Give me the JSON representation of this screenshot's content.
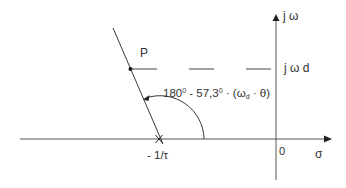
{
  "diagram": {
    "type": "s-plane root locus angle construction",
    "axes": {
      "imaginary_label": "j ω",
      "real_label": "σ",
      "origin_label": "0"
    },
    "point": {
      "label": "P",
      "jw_label": "j ω d"
    },
    "pole": {
      "label": "- 1/τ",
      "marker": "x"
    },
    "angle": {
      "part1": "180",
      "deg1": "0",
      "part2": " - 57,3",
      "deg2": "0",
      "part3": " · (ω",
      "sub": "d",
      "part4": " · θ)"
    },
    "colors": {
      "line": "#3a3a3a",
      "axis": "#555555",
      "background": "#ffffff"
    }
  }
}
